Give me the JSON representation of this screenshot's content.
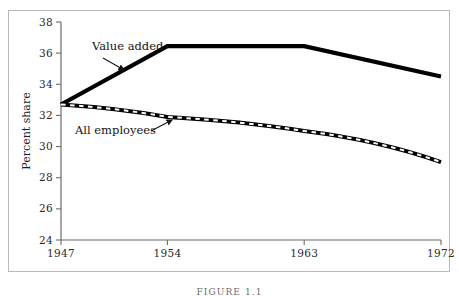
{
  "figure": {
    "caption": "FIGURE 1.1",
    "frame_color": "#b9b9b9",
    "background": "#ffffff"
  },
  "chart_data": {
    "type": "line",
    "title": "",
    "xlabel": "",
    "ylabel": "Percent share",
    "x": [
      1947,
      1954,
      1963,
      1972
    ],
    "xtick_labels": [
      "1947",
      "1954",
      "1963",
      "1972"
    ],
    "xlim": [
      1947,
      1972
    ],
    "ylim": [
      24,
      38
    ],
    "ytick_labels": [
      "24",
      "26",
      "28",
      "30",
      "32",
      "34",
      "36",
      "38"
    ],
    "yticks": [
      24,
      26,
      28,
      30,
      32,
      34,
      36,
      38
    ],
    "grid": false,
    "legend_position": "inline-annotations",
    "series": [
      {
        "name": "Value added",
        "values": [
          32.7,
          36.45,
          36.45,
          34.5
        ],
        "style": "solid",
        "color": "#000000",
        "width": 4.2,
        "annotation": {
          "label": "Value added",
          "label_x": 92,
          "label_y": 50,
          "arrow_from_x": 103,
          "arrow_from_y": 58,
          "arrow_to_x": 124,
          "arrow_to_y": 70
        }
      },
      {
        "name": "All employees",
        "values": [
          32.7,
          31.9,
          31.0,
          29.0
        ],
        "style": "white-dashed-overlay",
        "color": "#000000",
        "dash_color": "#ffffff",
        "width": 4.0,
        "annotation": {
          "label": "All employees",
          "label_x": 75,
          "label_y": 134,
          "arrow_from_x": 151,
          "arrow_from_y": 131,
          "arrow_to_x": 172,
          "arrow_to_y": 120
        }
      }
    ],
    "axis_geometry": {
      "left": 61,
      "right": 441,
      "top": 22,
      "bottom": 240,
      "tick_length": 5,
      "axis_color": "#6b6b6b"
    }
  }
}
